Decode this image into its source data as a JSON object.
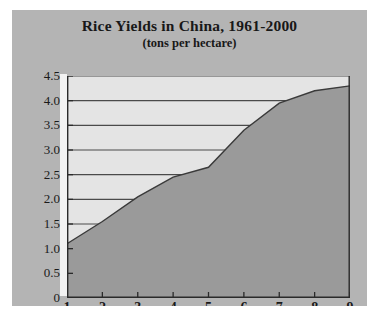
{
  "chart_data": {
    "type": "area",
    "title": "Rice Yields in China, 1961-2000",
    "subtitle": "(tons per hectare)",
    "xlabel": "",
    "ylabel": "",
    "x": [
      1,
      2,
      3,
      4,
      5,
      6,
      7,
      8,
      9
    ],
    "values": [
      1.1,
      1.55,
      2.05,
      2.45,
      2.65,
      3.4,
      3.95,
      4.2,
      4.3
    ],
    "series": [
      {
        "name": "Rice yield",
        "values": [
          1.1,
          1.55,
          2.05,
          2.45,
          2.65,
          3.4,
          3.95,
          4.2,
          4.3
        ]
      }
    ],
    "xlim": [
      1,
      9
    ],
    "ylim": [
      0,
      4.5
    ],
    "x_ticks": [
      "1",
      "2",
      "3",
      "4",
      "5",
      "6",
      "7",
      "8",
      "9"
    ],
    "y_ticks": [
      "0",
      "0.5",
      "1.0",
      "1.5",
      "2.0",
      "2.5",
      "3.0",
      "3.5",
      "4.0",
      "4.5"
    ],
    "y_tick_values": [
      0,
      0.5,
      1.0,
      1.5,
      2.0,
      2.5,
      3.0,
      3.5,
      4.0,
      4.5
    ],
    "gridlines": {
      "horizontal": true,
      "vertical": false,
      "values": [
        1.5,
        2.0,
        2.5,
        3.0,
        3.5,
        4.0,
        4.5
      ]
    },
    "legend": null,
    "annotations": [],
    "colors": {
      "figure_background": "#b4b4b4",
      "plot_background": "#e4e4e4",
      "area_fill": "#9a9a9a",
      "line": "#3a3a3a",
      "gridline": "#4a4a4a",
      "axis": "#2a2a2a",
      "text": "#1a1a1a",
      "gutter": "#f2f2f2"
    }
  }
}
